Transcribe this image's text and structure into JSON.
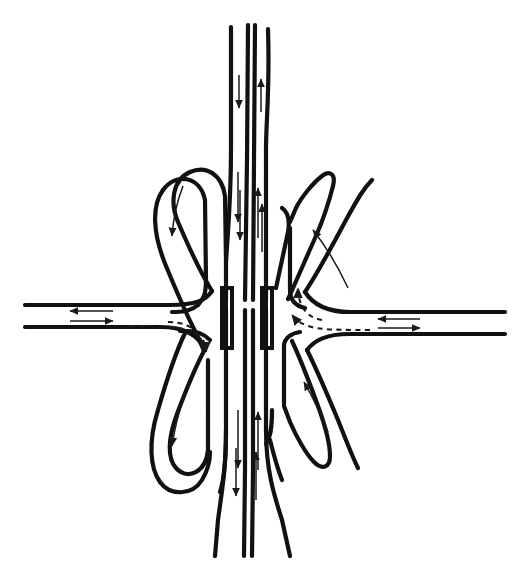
{
  "figure": {
    "caption": "",
    "header": "",
    "background_color": "#ffffff",
    "line_color": "#111111",
    "width": 527,
    "height": 580
  },
  "legend": {
    "solid_arrow_meaning": "through traffic movement",
    "dashed_arrow_meaning": "turning / ramp movement"
  },
  "roadways": [
    {
      "id": "mainline-vertical",
      "name": "Divided mainline freeway (north-south)",
      "orientation": "vertical",
      "carriageways": 2,
      "directions": [
        "southbound",
        "northbound"
      ]
    },
    {
      "id": "crossroad-horizontal",
      "name": "Divided cross road (east-west)",
      "orientation": "horizontal",
      "carriageways": 2,
      "directions": [
        "westbound",
        "eastbound"
      ]
    }
  ],
  "structures": [
    {
      "id": "overpass-bridge",
      "name": "Overpass bridge with abutment walls",
      "location": "center"
    }
  ],
  "ramps": [
    {
      "id": "loop-ramp-nw",
      "name": "Northwest loop ramp",
      "quadrant": "northwest",
      "movement": "southbound to westbound"
    },
    {
      "id": "diagonal-ramp-ne",
      "name": "Northeast directional ramp",
      "quadrant": "northeast",
      "movement": "eastbound to northbound"
    },
    {
      "id": "loop-ramp-sw",
      "name": "Southwest loop ramp",
      "quadrant": "southwest",
      "movement": "westbound to southbound"
    },
    {
      "id": "diagonal-ramp-se",
      "name": "Southeast directional ramp",
      "quadrant": "southeast",
      "movement": "northbound to eastbound"
    }
  ],
  "flow_arrows": [
    {
      "id": "arrow-mainline-south-top",
      "direction": "south",
      "style": "solid",
      "location": "top mainline left carriageway"
    },
    {
      "id": "arrow-mainline-north-top",
      "direction": "north",
      "style": "solid",
      "location": "top mainline right carriageway"
    },
    {
      "id": "arrow-mainline-south-bottom",
      "direction": "south",
      "style": "solid",
      "location": "bottom mainline left carriageway"
    },
    {
      "id": "arrow-mainline-north-bottom",
      "direction": "north",
      "style": "solid",
      "location": "bottom mainline right carriageway"
    },
    {
      "id": "arrow-crossroad-west-left",
      "direction": "west",
      "style": "solid",
      "location": "left cross road upper carriageway"
    },
    {
      "id": "arrow-crossroad-east-left",
      "direction": "east",
      "style": "solid",
      "location": "left cross road lower carriageway"
    },
    {
      "id": "arrow-crossroad-west-right",
      "direction": "west",
      "style": "solid",
      "location": "right cross road upper carriageway"
    },
    {
      "id": "arrow-crossroad-east-right",
      "direction": "east",
      "style": "solid",
      "location": "right cross road lower carriageway"
    },
    {
      "id": "arrow-ramp-nw",
      "direction": "southwest",
      "style": "solid",
      "location": "northwest loop ramp"
    },
    {
      "id": "arrow-ramp-ne",
      "direction": "northwest",
      "style": "solid",
      "location": "northeast directional ramp"
    },
    {
      "id": "arrow-ramp-sw",
      "direction": "southeast",
      "style": "solid",
      "location": "southwest loop ramp"
    },
    {
      "id": "arrow-ramp-se",
      "direction": "northeast",
      "style": "solid",
      "location": "southeast directional ramp"
    },
    {
      "id": "arrow-turn-left-dashed",
      "direction": "east then south",
      "style": "dashed",
      "location": "left of bridge"
    },
    {
      "id": "arrow-turn-right-dashed-a",
      "direction": "west",
      "style": "dashed",
      "location": "right of bridge lower"
    },
    {
      "id": "arrow-turn-right-dashed-b",
      "direction": "northwest",
      "style": "dashed",
      "location": "right of bridge upper"
    }
  ]
}
